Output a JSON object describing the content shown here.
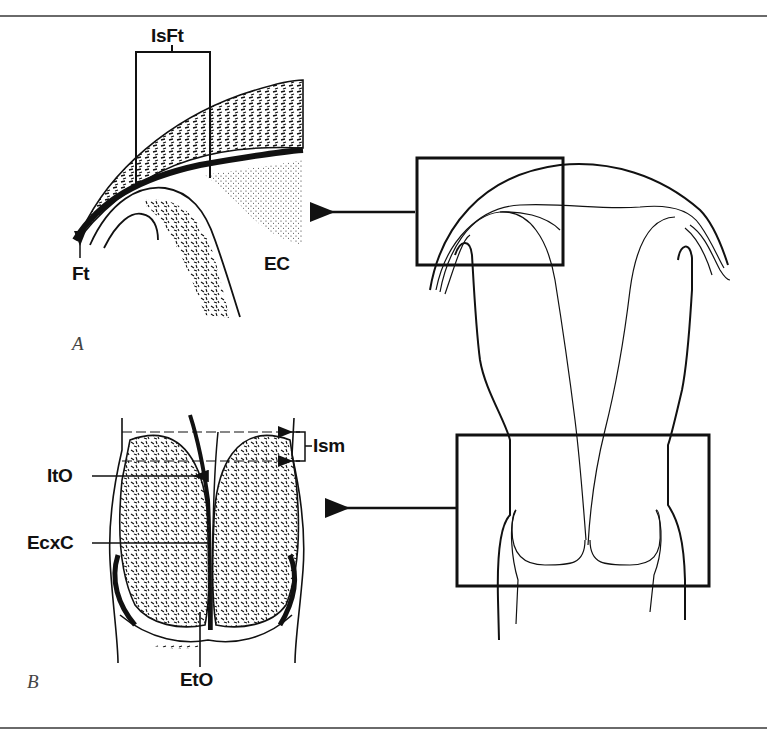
{
  "figure": {
    "panels": [
      {
        "id": "A",
        "label": "A",
        "description": "Magnified view of uterotubal junction / interstitial fallopian tube"
      },
      {
        "id": "B",
        "label": "B",
        "description": "Magnified view of cervix and isthmus"
      }
    ],
    "labels": {
      "isft": "IsFt",
      "ft": "Ft",
      "ec": "EC",
      "ism": "Ism",
      "ito": "ItO",
      "ecxc": "EcxC",
      "eto": "EtO"
    },
    "colors": {
      "line": "#111111",
      "rule": "#6a6a6a",
      "background": "#ffffff"
    }
  }
}
